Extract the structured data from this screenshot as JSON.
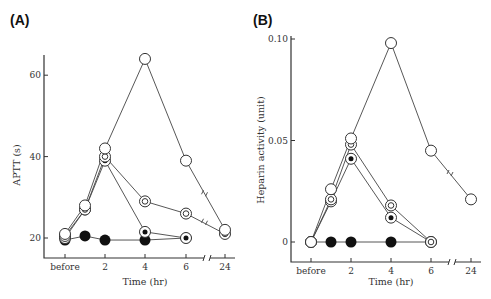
{
  "chart_data": [
    {
      "panel": "(A)",
      "type": "line",
      "title": "",
      "xlabel": "Time (hr)",
      "ylabel": "APTT (s)",
      "x_tick_labels": [
        "before",
        "2",
        "4",
        "6",
        "24"
      ],
      "x": [
        "before",
        "1",
        "2",
        "4",
        "6",
        "24"
      ],
      "y_ticks": [
        20,
        40,
        60
      ],
      "ylim": [
        15,
        66
      ],
      "axis_break_between": [
        "6",
        "24"
      ],
      "grid": false,
      "legend": "none (series distinguished by marker style)",
      "series": [
        {
          "name": "open circle",
          "marker": "open",
          "values": [
            21,
            28,
            42,
            64,
            39,
            22
          ]
        },
        {
          "name": "double circle",
          "marker": "double",
          "values": [
            20.5,
            27,
            40,
            29,
            26,
            21
          ]
        },
        {
          "name": "dotted circle",
          "marker": "dotted",
          "values": [
            20,
            27,
            39,
            21.5,
            20,
            null
          ]
        },
        {
          "name": "filled circle",
          "marker": "filled",
          "values": [
            19.5,
            20.5,
            19.5,
            19.5,
            20,
            null
          ]
        }
      ]
    },
    {
      "panel": "(B)",
      "type": "line",
      "title": "",
      "xlabel": "Time (hr)",
      "ylabel": "Heparin activity (unit)",
      "x_tick_labels": [
        "before",
        "2",
        "4",
        "6",
        "24"
      ],
      "x": [
        "before",
        "1",
        "2",
        "4",
        "6",
        "24"
      ],
      "y_ticks": [
        0,
        0.05,
        0.1
      ],
      "y_tick_labels": [
        "0",
        "0.05",
        "0.10"
      ],
      "ylim": [
        -0.01,
        0.1
      ],
      "axis_break_between": [
        "6",
        "24"
      ],
      "grid": false,
      "legend": "none (series distinguished by marker style)",
      "series": [
        {
          "name": "open circle",
          "marker": "open",
          "values": [
            0,
            0.026,
            0.051,
            0.098,
            0.045,
            0.021
          ]
        },
        {
          "name": "double circle",
          "marker": "double",
          "values": [
            0,
            0.021,
            0.048,
            0.018,
            0,
            null
          ]
        },
        {
          "name": "dotted circle",
          "marker": "dotted",
          "values": [
            0,
            0.02,
            0.041,
            0.012,
            0,
            null
          ]
        },
        {
          "name": "filled circle",
          "marker": "filled",
          "values": [
            0,
            0,
            0,
            0,
            0,
            null
          ]
        }
      ]
    }
  ],
  "labels": {
    "panelA": "(A)",
    "panelB": "(B)",
    "a_ylabel": "APTT (s)",
    "b_ylabel": "Heparin activity (unit)",
    "xlabel": "Time (hr)",
    "a_yticks": [
      "20",
      "40",
      "60"
    ],
    "b_yticks": [
      "0",
      "0.05",
      "0.10"
    ],
    "xticks": [
      "before",
      "2",
      "4",
      "6",
      "24"
    ]
  }
}
